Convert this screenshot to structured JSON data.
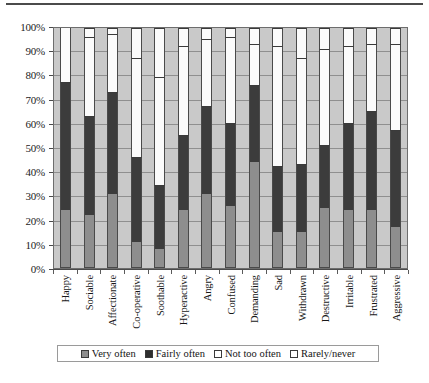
{
  "chart_data": {
    "type": "bar",
    "subtype": "stacked-percent-column",
    "title": "",
    "xlabel": "",
    "ylabel": "",
    "ylim": [
      0,
      100
    ],
    "ytick_labels": [
      "0%",
      "10%",
      "20%",
      "30%",
      "40%",
      "50%",
      "60%",
      "70%",
      "80%",
      "90%",
      "100%"
    ],
    "ytick_values": [
      0,
      10,
      20,
      30,
      40,
      50,
      60,
      70,
      80,
      90,
      100
    ],
    "grid": true,
    "legend_position": "bottom",
    "categories": [
      "Happy",
      "Sociable",
      "Affectionate",
      "Co-operative",
      "Soothable",
      "Hyperactive",
      "Angry",
      "Confused",
      "Demanding",
      "Sad",
      "Withdrawn",
      "Destructive",
      "Irritable",
      "Frustrated",
      "Aggressive"
    ],
    "series": [
      {
        "name": "Very often",
        "color": "#8e8e8e",
        "values": [
          24,
          22,
          31,
          11,
          8,
          24,
          31,
          26,
          44,
          15,
          15,
          25,
          24,
          24,
          17
        ]
      },
      {
        "name": "Fairly often",
        "color": "#3c3c3c",
        "values": [
          53,
          41,
          42,
          35,
          26,
          31,
          36,
          34,
          32,
          27,
          28,
          26,
          36,
          41,
          40
        ]
      },
      {
        "name": "Not too often",
        "color": "#fbfbfb",
        "values": [
          23,
          33,
          24,
          41,
          45,
          37,
          28,
          36,
          17,
          50,
          44,
          40,
          32,
          28,
          36
        ]
      },
      {
        "name": "Rarely/never",
        "color": "#fbfbfb",
        "values": [
          0,
          4,
          3,
          13,
          21,
          8,
          5,
          4,
          7,
          8,
          13,
          9,
          8,
          7,
          7
        ]
      }
    ],
    "cumulative_tops": {
      "very_often": [
        24,
        22,
        31,
        11,
        8,
        24,
        31,
        26,
        44,
        15,
        15,
        25,
        24,
        24,
        17
      ],
      "fairly_often": [
        77,
        63,
        73,
        46,
        34,
        55,
        67,
        60,
        76,
        42,
        43,
        51,
        60,
        65,
        57
      ],
      "not_too_often": [
        100,
        96,
        97,
        87,
        79,
        92,
        95,
        96,
        93,
        92,
        87,
        91,
        92,
        93,
        93
      ]
    }
  },
  "legend": {
    "entries": [
      {
        "label": "Very often",
        "swatch": "very"
      },
      {
        "label": "Fairly often",
        "swatch": "fairly"
      },
      {
        "label": "Not too often",
        "swatch": "nottoo"
      },
      {
        "label": "Rarely/never",
        "swatch": "rarely"
      }
    ]
  }
}
